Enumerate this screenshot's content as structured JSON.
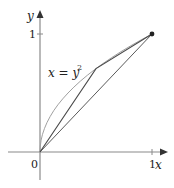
{
  "figure": {
    "curve_label_main": "x = y",
    "curve_label_exp": "2",
    "x_axis_label": "x",
    "y_axis_label": "y",
    "origin_label": "0",
    "x_tick_label": "1",
    "y_tick_label": "1"
  },
  "diagram_data": {
    "curve": {
      "equation": "x = y^2",
      "from": [
        0,
        0
      ],
      "to": [
        1,
        1
      ]
    },
    "chords": [
      {
        "from": [
          0,
          0
        ],
        "to": [
          1,
          1
        ]
      },
      {
        "from": [
          0,
          0
        ],
        "to": [
          0.5,
          0.707
        ]
      },
      {
        "from": [
          0.5,
          0.707
        ],
        "to": [
          1,
          1
        ]
      }
    ],
    "endpoint_marker": [
      1,
      1
    ],
    "axes": {
      "x_ticks": [
        1
      ],
      "y_ticks": [
        1
      ]
    }
  },
  "colors": {
    "axis": "#888888",
    "curve": "#9a9a9a",
    "chord": "#555555",
    "text": "#222222"
  }
}
